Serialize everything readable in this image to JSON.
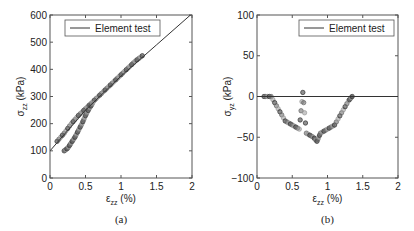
{
  "chart_data": [
    {
      "type": "scatter",
      "panel": "(a)",
      "xlabel": "ε_zz (%)",
      "ylabel": "σ_zz (kPa)",
      "xlim": [
        0,
        2
      ],
      "ylim": [
        0,
        600
      ],
      "xticks": [
        "0",
        "0.5",
        "1",
        "1.5",
        "2"
      ],
      "yticks": [
        "0",
        "100",
        "200",
        "300",
        "400",
        "500",
        "600"
      ],
      "legend": [
        "Element test"
      ],
      "legend_position": "upper left",
      "grid": false,
      "series": [
        {
          "name": "Element test",
          "kind": "line",
          "x": [
            0,
            0.5,
            1.0,
            1.5,
            2.0
          ],
          "y": [
            100,
            250,
            375,
            490,
            605
          ]
        },
        {
          "name": "DEM points (upper branch)",
          "kind": "scatter",
          "x": [
            0.1,
            0.2,
            0.3,
            0.4,
            0.5,
            0.6,
            0.7,
            0.8,
            0.9,
            1.0,
            1.1,
            1.2,
            1.3
          ],
          "y": [
            135,
            165,
            200,
            230,
            255,
            280,
            305,
            330,
            355,
            380,
            405,
            430,
            450
          ]
        },
        {
          "name": "DEM points (lower branch)",
          "kind": "scatter",
          "x": [
            0.2,
            0.25,
            0.3,
            0.35,
            0.4,
            0.45,
            0.5,
            0.55,
            0.6
          ],
          "y": [
            100,
            110,
            130,
            150,
            175,
            200,
            230,
            255,
            275
          ]
        }
      ],
      "caption": "(a)"
    },
    {
      "type": "scatter",
      "panel": "(b)",
      "xlabel": "ε_zz (%)",
      "ylabel": "σ_yz (kPa)",
      "xlim": [
        0,
        2
      ],
      "ylim": [
        -100,
        100
      ],
      "xticks": [
        "0",
        "0.5",
        "1",
        "1.5",
        "2"
      ],
      "yticks": [
        "-100",
        "-50",
        "0",
        "50",
        "100"
      ],
      "legend": [
        "Element test"
      ],
      "legend_position": "upper right",
      "grid": false,
      "series": [
        {
          "name": "Element test",
          "kind": "line",
          "x": [
            0,
            2
          ],
          "y": [
            0,
            0
          ]
        },
        {
          "name": "DEM points",
          "kind": "scatter",
          "x": [
            0.1,
            0.2,
            0.3,
            0.4,
            0.5,
            0.6,
            0.65,
            0.7,
            0.8,
            0.85,
            0.9,
            1.0,
            1.1,
            1.2,
            1.3,
            1.35
          ],
          "y": [
            0,
            0,
            -15,
            -30,
            -35,
            -40,
            5,
            -45,
            -50,
            -55,
            -45,
            -40,
            -35,
            -20,
            -5,
            0
          ]
        }
      ],
      "caption": "(b)"
    }
  ],
  "panels": {
    "a": {
      "ylabel_main": "σ",
      "ylabel_sub": "zz",
      "ylabel_unit": "(kPa)",
      "xlabel_main": "ε",
      "xlabel_sub": "zz",
      "xlabel_unit": "(%)",
      "legend": "Element test",
      "caption": "(a)"
    },
    "b": {
      "ylabel_main": "σ",
      "ylabel_sub": "yz",
      "ylabel_unit": "(kPa)",
      "xlabel_main": "ε",
      "xlabel_sub": "zz",
      "xlabel_unit": "(%)",
      "legend": "Element test",
      "caption": "(b)"
    }
  },
  "colors": {
    "axis": "#555555",
    "line": "#333333",
    "marker_dark": "#333333",
    "marker_light": "#999999"
  }
}
